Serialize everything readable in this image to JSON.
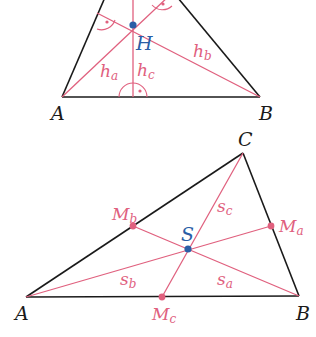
{
  "figure1": {
    "title": "Altitudes and orthocenter",
    "vertices": {
      "A": "A",
      "B": "B"
    },
    "orthocenter": "H",
    "altitudes": [
      {
        "main": "h",
        "sub": "a"
      },
      {
        "main": "h",
        "sub": "b"
      },
      {
        "main": "h",
        "sub": "c"
      }
    ]
  },
  "figure2": {
    "title": "Medians and centroid",
    "vertices": {
      "A": "A",
      "B": "B",
      "C": "C"
    },
    "centroid": "S",
    "midpoints": [
      {
        "main": "M",
        "sub": "a"
      },
      {
        "main": "M",
        "sub": "b"
      },
      {
        "main": "M",
        "sub": "c"
      }
    ],
    "medians": [
      {
        "main": "s",
        "sub": "a"
      },
      {
        "main": "s",
        "sub": "b"
      },
      {
        "main": "s",
        "sub": "c"
      }
    ]
  },
  "colors": {
    "line": "#1a1a1a",
    "accent": "#e0607e",
    "point": "#2a5ea6"
  }
}
